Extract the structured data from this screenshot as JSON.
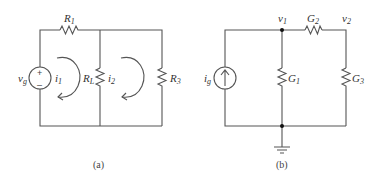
{
  "figure_a": {
    "caption": "(a)",
    "source": {
      "name": "v",
      "sub": "g",
      "plus": "+",
      "minus": "–"
    },
    "resistors": [
      {
        "name": "R",
        "sub": "1"
      },
      {
        "name": "R",
        "sub": "L"
      },
      {
        "name": "R",
        "sub": "3"
      }
    ],
    "mesh_currents": [
      {
        "name": "i",
        "sub": "1"
      },
      {
        "name": "i",
        "sub": "2"
      }
    ]
  },
  "figure_b": {
    "caption": "(b)",
    "source": {
      "name": "i",
      "sub": "g"
    },
    "conductances": [
      {
        "name": "G",
        "sub": "1"
      },
      {
        "name": "G",
        "sub": "2"
      },
      {
        "name": "G",
        "sub": "3"
      }
    ],
    "nodes": [
      {
        "name": "v",
        "sub": "1"
      },
      {
        "name": "v",
        "sub": "2"
      }
    ]
  }
}
